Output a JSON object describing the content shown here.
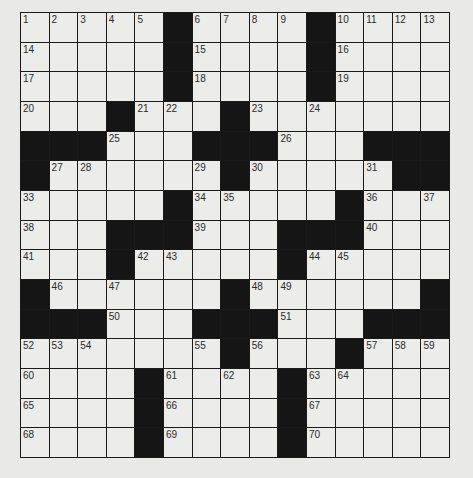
{
  "puzzle": {
    "size": {
      "rows": 15,
      "cols": 15
    },
    "colors": {
      "black": "#151515",
      "white": "#ececea",
      "line": "#1a1a1a",
      "page": "#e9e9e7"
    },
    "layout": [
      "00000#0000#0000",
      "00000#0000#0000",
      "00000#0000#0000",
      "000#000#0000000",
      "###000###000###",
      "#000000#00000##",
      "00000#00000#000",
      "000###000###000",
      "000#00000#00000",
      "#000000#000000#",
      "###000###000###",
      "0000000#000#000",
      "0000#0000#00000",
      "0000#0000#00000",
      "0000#0000#00000"
    ],
    "numbers": [
      {
        "r": 0,
        "c": 0,
        "n": "1"
      },
      {
        "r": 0,
        "c": 1,
        "n": "2"
      },
      {
        "r": 0,
        "c": 2,
        "n": "3"
      },
      {
        "r": 0,
        "c": 3,
        "n": "4"
      },
      {
        "r": 0,
        "c": 4,
        "n": "5"
      },
      {
        "r": 0,
        "c": 6,
        "n": "6"
      },
      {
        "r": 0,
        "c": 7,
        "n": "7"
      },
      {
        "r": 0,
        "c": 8,
        "n": "8"
      },
      {
        "r": 0,
        "c": 9,
        "n": "9"
      },
      {
        "r": 0,
        "c": 11,
        "n": "10"
      },
      {
        "r": 0,
        "c": 12,
        "n": "11"
      },
      {
        "r": 0,
        "c": 13,
        "n": "12"
      },
      {
        "r": 0,
        "c": 14,
        "n": "13"
      },
      {
        "r": 1,
        "c": 0,
        "n": "14"
      },
      {
        "r": 1,
        "c": 6,
        "n": "15"
      },
      {
        "r": 1,
        "c": 11,
        "n": "16"
      },
      {
        "r": 2,
        "c": 0,
        "n": "17"
      },
      {
        "r": 2,
        "c": 6,
        "n": "18"
      },
      {
        "r": 2,
        "c": 11,
        "n": "19"
      },
      {
        "r": 3,
        "c": 0,
        "n": "20"
      },
      {
        "r": 3,
        "c": 4,
        "n": "21"
      },
      {
        "r": 3,
        "c": 5,
        "n": "22"
      },
      {
        "r": 3,
        "c": 8,
        "n": "23"
      },
      {
        "r": 3,
        "c": 10,
        "n": "24"
      },
      {
        "r": 4,
        "c": 3,
        "n": "25"
      },
      {
        "r": 4,
        "c": 9,
        "n": "26"
      },
      {
        "r": 5,
        "c": 1,
        "n": "27"
      },
      {
        "r": 5,
        "c": 2,
        "n": "28"
      },
      {
        "r": 5,
        "c": 6,
        "n": "29"
      },
      {
        "r": 5,
        "c": 8,
        "n": "30"
      },
      {
        "r": 5,
        "c": 12,
        "n": "31"
      },
      {
        "r": 5,
        "c": 13,
        "n": "32"
      },
      {
        "r": 6,
        "c": 0,
        "n": "33"
      },
      {
        "r": 6,
        "c": 6,
        "n": "34"
      },
      {
        "r": 6,
        "c": 7,
        "n": "35"
      },
      {
        "r": 6,
        "c": 12,
        "n": "36"
      },
      {
        "r": 6,
        "c": 14,
        "n": "37"
      },
      {
        "r": 7,
        "c": 0,
        "n": "38"
      },
      {
        "r": 7,
        "c": 6,
        "n": "39"
      },
      {
        "r": 7,
        "c": 12,
        "n": "40"
      },
      {
        "r": 8,
        "c": 0,
        "n": "41"
      },
      {
        "r": 8,
        "c": 4,
        "n": "42"
      },
      {
        "r": 8,
        "c": 5,
        "n": "43"
      },
      {
        "r": 8,
        "c": 10,
        "n": "44"
      },
      {
        "r": 8,
        "c": 11,
        "n": "45"
      },
      {
        "r": 9,
        "c": 1,
        "n": "46"
      },
      {
        "r": 9,
        "c": 3,
        "n": "47"
      },
      {
        "r": 9,
        "c": 8,
        "n": "48"
      },
      {
        "r": 9,
        "c": 9,
        "n": "49"
      },
      {
        "r": 10,
        "c": 3,
        "n": "50"
      },
      {
        "r": 10,
        "c": 9,
        "n": "51"
      },
      {
        "r": 11,
        "c": 0,
        "n": "52"
      },
      {
        "r": 11,
        "c": 1,
        "n": "53"
      },
      {
        "r": 11,
        "c": 2,
        "n": "54"
      },
      {
        "r": 11,
        "c": 6,
        "n": "55"
      },
      {
        "r": 11,
        "c": 8,
        "n": "56"
      },
      {
        "r": 11,
        "c": 12,
        "n": "57"
      },
      {
        "r": 11,
        "c": 13,
        "n": "58"
      },
      {
        "r": 11,
        "c": 14,
        "n": "59"
      },
      {
        "r": 12,
        "c": 0,
        "n": "60"
      },
      {
        "r": 12,
        "c": 5,
        "n": "61"
      },
      {
        "r": 12,
        "c": 7,
        "n": "62"
      },
      {
        "r": 12,
        "c": 10,
        "n": "63"
      },
      {
        "r": 12,
        "c": 11,
        "n": "64"
      },
      {
        "r": 13,
        "c": 0,
        "n": "65"
      },
      {
        "r": 13,
        "c": 5,
        "n": "66"
      },
      {
        "r": 13,
        "c": 10,
        "n": "67"
      },
      {
        "r": 14,
        "c": 0,
        "n": "68"
      },
      {
        "r": 14,
        "c": 5,
        "n": "69"
      },
      {
        "r": 14,
        "c": 10,
        "n": "70"
      }
    ]
  }
}
